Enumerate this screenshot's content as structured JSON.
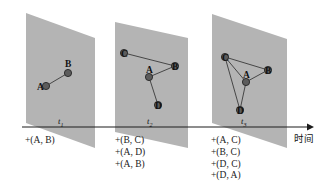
{
  "figure": {
    "type": "temporal-graph-evolution-diagram",
    "width": 331,
    "height": 194,
    "background_color": "#ffffff",
    "plane_fill_color": "#b4b4b4",
    "node_fill_color": "#5c5c5c",
    "edge_color": "#3a3a3a",
    "axis_color": "#1c1c1c"
  },
  "axis": {
    "caption": "时间",
    "arrow_direction": "right"
  },
  "snapshots": [
    {
      "id": "t1",
      "time_label": "t",
      "time_subscript": "1",
      "nodes": [
        {
          "id": "A",
          "label": "A",
          "x": 46,
          "y": 86,
          "label_dx": -9,
          "label_dy": -3
        },
        {
          "id": "B",
          "label": "B",
          "x": 68,
          "y": 73,
          "label_dx": -3,
          "label_dy": -13
        }
      ],
      "edges": [
        {
          "from": "A",
          "to": "B"
        }
      ],
      "operations": [
        "+(A, B)"
      ]
    },
    {
      "id": "t2",
      "time_label": "t",
      "time_subscript": "2",
      "nodes": [
        {
          "id": "C",
          "label": "C",
          "x": 124,
          "y": 53,
          "label_dx": -3,
          "label_dy": -3
        },
        {
          "id": "B",
          "label": "B",
          "x": 175,
          "y": 66,
          "label_dx": -3,
          "label_dy": -3
        },
        {
          "id": "A",
          "label": "A",
          "x": 149,
          "y": 77,
          "label_dx": -3,
          "label_dy": -11
        },
        {
          "id": "D",
          "label": "D",
          "x": 158,
          "y": 105,
          "label_dx": -3,
          "label_dy": -3
        }
      ],
      "edges": [
        {
          "from": "C",
          "to": "B"
        },
        {
          "from": "A",
          "to": "B"
        },
        {
          "from": "A",
          "to": "D"
        }
      ],
      "operations": [
        "+(B, C)",
        "+(A, D)",
        "+(A, B)"
      ]
    },
    {
      "id": "t3",
      "time_label": "t",
      "time_subscript": "3",
      "nodes": [
        {
          "id": "C",
          "label": "C",
          "x": 225,
          "y": 57,
          "label_dx": -3,
          "label_dy": -3
        },
        {
          "id": "B",
          "label": "B",
          "x": 268,
          "y": 70,
          "label_dx": -3,
          "label_dy": -3
        },
        {
          "id": "A",
          "label": "A",
          "x": 246,
          "y": 82,
          "label_dx": -3,
          "label_dy": -11
        },
        {
          "id": "D",
          "label": "D",
          "x": 240,
          "y": 110,
          "label_dx": -3,
          "label_dy": -3
        }
      ],
      "edges": [
        {
          "from": "C",
          "to": "B"
        },
        {
          "from": "C",
          "to": "A"
        },
        {
          "from": "C",
          "to": "D"
        },
        {
          "from": "A",
          "to": "B"
        },
        {
          "from": "A",
          "to": "D"
        }
      ],
      "operations": [
        "+(A, C)",
        "+(B, C)",
        "+(D, C)",
        "+(D, A)"
      ]
    }
  ]
}
